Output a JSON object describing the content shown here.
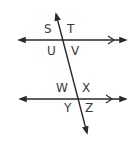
{
  "diagram": {
    "type": "parallel-lines-transversal",
    "colors": {
      "line": "#2a2a2a",
      "label": "#3a3a3a",
      "background": "#ffffff"
    },
    "lines": [
      {
        "name": "top-parallel-line",
        "x1": 18,
        "y1": 40,
        "x2": 127,
        "y2": 40,
        "parallel_marker": ">"
      },
      {
        "name": "bottom-parallel-line",
        "x1": 19,
        "y1": 99,
        "x2": 127,
        "y2": 99,
        "parallel_marker": ">"
      },
      {
        "name": "transversal",
        "x1": 55,
        "y1": 12,
        "x2": 88,
        "y2": 135
      }
    ],
    "labels": {
      "s": "S",
      "t": "T",
      "u": "U",
      "v": "V",
      "w": "W",
      "x": "X",
      "y": "Y",
      "z": "Z"
    }
  }
}
